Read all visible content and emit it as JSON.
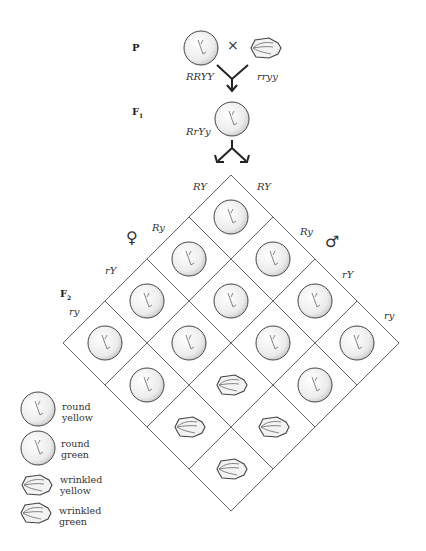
{
  "generations": {
    "p": "P",
    "f1": "F",
    "f1_sub": "1",
    "f2": "F",
    "f2_sub": "2"
  },
  "parents": {
    "left_genotype": "RRYY",
    "right_genotype": "rryy",
    "cross_symbol": "×"
  },
  "f1": {
    "genotype": "RrYy"
  },
  "gametes": {
    "female_symbol": "♀",
    "male_symbol": "♂",
    "female": [
      "RY",
      "Ry",
      "rY",
      "ry"
    ],
    "male": [
      "RY",
      "Ry",
      "rY",
      "ry"
    ]
  },
  "legend": [
    {
      "line1": "round",
      "line2": "yellow",
      "shape": "round",
      "color": "yellow"
    },
    {
      "line1": "round",
      "line2": "green",
      "shape": "round",
      "color": "green"
    },
    {
      "line1": "wrinkled",
      "line2": "yellow",
      "shape": "wrinkled",
      "color": "yellow"
    },
    {
      "line1": "wrinkled",
      "line2": "green",
      "shape": "wrinkled",
      "color": "green"
    }
  ],
  "punnett": {
    "rows_female": [
      "RY",
      "Ry",
      "rY",
      "ry"
    ],
    "cols_male": [
      "RY",
      "Ry",
      "rY",
      "ry"
    ],
    "phenotypes": [
      [
        "round-yellow",
        "round-yellow",
        "round-yellow",
        "round-yellow"
      ],
      [
        "round-yellow",
        "round-green",
        "round-yellow",
        "round-green"
      ],
      [
        "round-yellow",
        "round-yellow",
        "wrinkled-yellow",
        "wrinkled-yellow"
      ],
      [
        "round-yellow",
        "round-green",
        "wrinkled-yellow",
        "wrinkled-green"
      ]
    ]
  },
  "colors": {
    "line": "#555555",
    "seed_fill": "#f2f2f2",
    "seed_shade": "#cfcfcf"
  }
}
